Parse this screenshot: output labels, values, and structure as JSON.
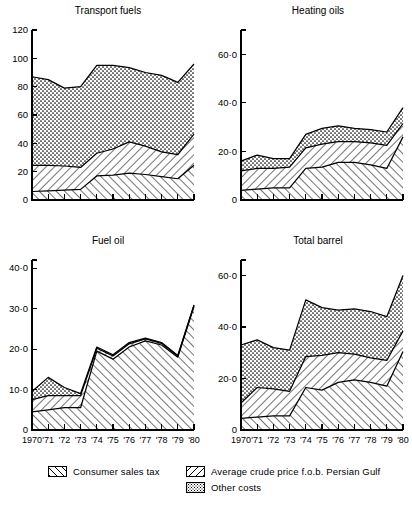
{
  "figure": {
    "width": 412,
    "height": 514,
    "background": "#ffffff",
    "ink_color": "#000000"
  },
  "legend": {
    "items": [
      {
        "key": "consumer_sales_tax",
        "label": "Consumer sales tax",
        "pattern": "back-hatch"
      },
      {
        "key": "average_crude_price",
        "label": "Average crude price f.o.b. Persian Gulf",
        "pattern": "forward-hatch"
      },
      {
        "key": "other_costs",
        "label": "Other costs",
        "pattern": "dots"
      }
    ]
  },
  "chart_data": [
    {
      "id": "transport-fuels",
      "type": "area",
      "stacked": true,
      "title": "Transport fuels",
      "xlabel": "",
      "ylabel": "",
      "grid": false,
      "legend_position": "figure-bottom",
      "x": [
        1970,
        1971,
        1972,
        1973,
        1974,
        1975,
        1976,
        1977,
        1978,
        1979,
        1980
      ],
      "tick_labels": [
        "1970",
        "'71",
        "'72",
        "'73",
        "'74",
        "'75",
        "'76",
        "'77",
        "'78",
        "'79",
        "'80"
      ],
      "ylim": [
        0,
        120
      ],
      "yticks": [
        0,
        20,
        40,
        60,
        80,
        100,
        120
      ],
      "ytick_labels": [
        "0",
        "20",
        "40",
        "60",
        "80",
        "100",
        "120"
      ],
      "series": [
        {
          "name": "Average crude price f.o.b. Persian Gulf",
          "pattern": "forward-hatch",
          "values": [
            6.0,
            6.5,
            7.0,
            7.5,
            17.0,
            17.5,
            19.0,
            18.0,
            16.5,
            15.0,
            24.5
          ]
        },
        {
          "name": "Consumer sales tax",
          "pattern": "back-hatch",
          "values": [
            18.5,
            18.0,
            17.0,
            15.5,
            16.0,
            18.5,
            22.0,
            20.0,
            17.5,
            17.0,
            22.0
          ]
        },
        {
          "name": "Other costs",
          "pattern": "dots",
          "values": [
            62.5,
            60.5,
            55.0,
            57.0,
            62.0,
            59.0,
            52.5,
            52.0,
            54.0,
            51.0,
            49.5
          ]
        }
      ],
      "cumulative_tops": {
        "crude": [
          6.0,
          6.5,
          7.0,
          7.5,
          17.0,
          17.5,
          19.0,
          18.0,
          16.5,
          15.0,
          24.5
        ],
        "plus_tax": [
          24.5,
          24.5,
          24.0,
          23.0,
          33.0,
          36.0,
          41.0,
          38.0,
          34.0,
          32.0,
          46.5
        ],
        "plus_other": [
          87.0,
          85.0,
          79.0,
          80.0,
          95.0,
          95.0,
          93.5,
          90.0,
          88.0,
          83.0,
          96.0
        ]
      }
    },
    {
      "id": "heating-oils",
      "type": "area",
      "stacked": true,
      "title": "Heating oils",
      "xlabel": "",
      "ylabel": "",
      "grid": false,
      "legend_position": "figure-bottom",
      "x": [
        1970,
        1971,
        1972,
        1973,
        1974,
        1975,
        1976,
        1977,
        1978,
        1979,
        1980
      ],
      "tick_labels": [
        "1970",
        "'71",
        "'72",
        "'73",
        "'74",
        "'75",
        "'76",
        "'77",
        "'78",
        "'79",
        "'80"
      ],
      "ylim": [
        0,
        70
      ],
      "yticks": [
        0,
        20,
        40,
        60
      ],
      "ytick_labels": [
        "0",
        "20·0",
        "40·0",
        "60·0"
      ],
      "series": [
        {
          "name": "Average crude price f.o.b. Persian Gulf",
          "pattern": "forward-hatch",
          "values": [
            4.0,
            4.5,
            5.0,
            5.0,
            13.0,
            13.5,
            15.5,
            15.5,
            14.5,
            13.0,
            26.0
          ]
        },
        {
          "name": "Consumer sales tax",
          "pattern": "back-hatch",
          "values": [
            8.0,
            8.5,
            8.0,
            8.5,
            8.5,
            9.5,
            8.5,
            8.5,
            9.0,
            9.5,
            5.5
          ]
        },
        {
          "name": "Other costs",
          "pattern": "dots",
          "values": [
            4.0,
            5.5,
            4.0,
            3.5,
            5.5,
            6.5,
            6.5,
            5.5,
            5.5,
            5.5,
            6.5
          ]
        }
      ],
      "cumulative_tops": {
        "crude": [
          4.0,
          4.5,
          5.0,
          5.0,
          13.0,
          13.5,
          15.5,
          15.5,
          14.5,
          13.0,
          26.0
        ],
        "plus_tax": [
          12.0,
          13.0,
          13.0,
          13.5,
          21.5,
          23.0,
          24.0,
          24.0,
          23.5,
          22.5,
          31.5
        ],
        "plus_other": [
          16.0,
          18.5,
          17.0,
          17.0,
          27.0,
          29.5,
          30.5,
          29.5,
          29.0,
          28.0,
          38.0
        ]
      }
    },
    {
      "id": "fuel-oil",
      "type": "area",
      "stacked": true,
      "title": "Fuel oil",
      "xlabel": "",
      "ylabel": "",
      "grid": false,
      "legend_position": "figure-bottom",
      "x": [
        1970,
        1971,
        1972,
        1973,
        1974,
        1975,
        1976,
        1977,
        1978,
        1979,
        1980
      ],
      "tick_labels": [
        "1970",
        "'71",
        "'72",
        "'73",
        "'74",
        "'75",
        "'76",
        "'77",
        "'78",
        "'79",
        "'80"
      ],
      "ylim": [
        0,
        42
      ],
      "yticks": [
        0,
        10,
        20,
        30,
        40
      ],
      "ytick_labels": [
        "0",
        "10·0",
        "20·0",
        "30·0",
        "40·0"
      ],
      "series": [
        {
          "name": "Average crude price f.o.b. Persian Gulf",
          "pattern": "forward-hatch",
          "values": [
            4.5,
            5.0,
            5.5,
            5.5,
            19.5,
            17.5,
            20.5,
            22.0,
            21.0,
            18.0,
            30.5
          ]
        },
        {
          "name": "Consumer sales tax",
          "pattern": "back-hatch",
          "values": [
            3.0,
            3.5,
            3.0,
            3.0,
            0.7,
            0.8,
            0.8,
            0.5,
            0.4,
            0.3,
            0.3
          ]
        },
        {
          "name": "Other costs",
          "pattern": "dots",
          "values": [
            2.0,
            4.5,
            2.0,
            0.5,
            0.3,
            0.3,
            0.3,
            0.2,
            0.2,
            0.1,
            0.1
          ]
        }
      ],
      "cumulative_tops": {
        "crude": [
          4.5,
          5.0,
          5.5,
          5.5,
          19.5,
          17.5,
          20.5,
          22.0,
          21.0,
          18.0,
          30.5
        ],
        "plus_tax": [
          7.5,
          8.5,
          8.5,
          8.5,
          20.2,
          18.3,
          21.3,
          22.5,
          21.4,
          18.3,
          30.8
        ],
        "plus_other": [
          9.5,
          13.0,
          10.5,
          9.0,
          20.5,
          18.6,
          21.6,
          22.7,
          21.6,
          18.4,
          30.9
        ]
      }
    },
    {
      "id": "total-barrel",
      "type": "area",
      "stacked": true,
      "title": "Total barrel",
      "xlabel": "",
      "ylabel": "",
      "grid": false,
      "legend_position": "figure-bottom",
      "x": [
        1970,
        1971,
        1972,
        1973,
        1974,
        1975,
        1976,
        1977,
        1978,
        1979,
        1980
      ],
      "tick_labels": [
        "1970",
        "'71",
        "'72",
        "'73",
        "'74",
        "'75",
        "'76",
        "'77",
        "'78",
        "'79",
        "'80"
      ],
      "ylim": [
        0,
        66
      ],
      "yticks": [
        0,
        20,
        40,
        60
      ],
      "ytick_labels": [
        "0",
        "20·0",
        "40·0",
        "60·0"
      ],
      "series": [
        {
          "name": "Average crude price f.o.b. Persian Gulf",
          "pattern": "forward-hatch",
          "values": [
            4.5,
            5.0,
            5.5,
            5.5,
            16.5,
            15.5,
            18.5,
            19.5,
            18.5,
            17.0,
            30.5
          ]
        },
        {
          "name": "Consumer sales tax",
          "pattern": "back-hatch",
          "values": [
            6.0,
            11.5,
            10.5,
            9.5,
            12.0,
            13.5,
            11.5,
            10.0,
            9.5,
            10.0,
            8.0
          ]
        },
        {
          "name": "Other costs",
          "pattern": "dots",
          "values": [
            22.5,
            18.5,
            16.0,
            16.0,
            22.0,
            18.5,
            16.5,
            17.5,
            18.0,
            17.0,
            21.5
          ]
        }
      ],
      "cumulative_tops": {
        "crude": [
          4.5,
          5.0,
          5.5,
          5.5,
          16.5,
          15.5,
          18.5,
          19.5,
          18.5,
          17.0,
          30.5
        ],
        "plus_tax": [
          10.5,
          16.5,
          16.0,
          15.0,
          28.5,
          29.0,
          30.0,
          29.5,
          28.0,
          27.0,
          38.5
        ],
        "plus_other": [
          33.0,
          35.0,
          32.0,
          31.0,
          50.5,
          47.5,
          46.5,
          47.0,
          46.0,
          44.0,
          60.0
        ]
      }
    }
  ]
}
